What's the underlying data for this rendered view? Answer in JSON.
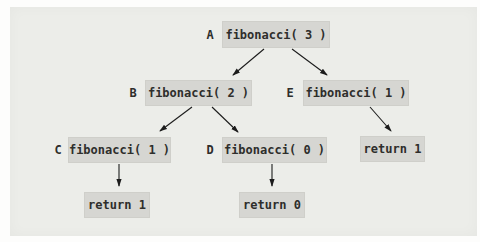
{
  "figure": {
    "nodes": {
      "A": {
        "label": "A",
        "text": "fibonacci( 3 )"
      },
      "B": {
        "label": "B",
        "text": "fibonacci( 2 )"
      },
      "E": {
        "label": "E",
        "text": "fibonacci( 1 )"
      },
      "C": {
        "label": "C",
        "text": "fibonacci( 1 )"
      },
      "D": {
        "label": "D",
        "text": "fibonacci( 0 )"
      },
      "return_E": {
        "text": "return 1"
      },
      "return_C": {
        "text": "return 1"
      },
      "return_D": {
        "text": "return 0"
      }
    },
    "edges": [
      {
        "from": "A",
        "to": "B"
      },
      {
        "from": "A",
        "to": "E"
      },
      {
        "from": "B",
        "to": "C"
      },
      {
        "from": "B",
        "to": "D"
      },
      {
        "from": "E",
        "to": "return_E"
      },
      {
        "from": "C",
        "to": "return_C"
      },
      {
        "from": "D",
        "to": "return_D"
      }
    ],
    "colors": {
      "box_fill": "#d6d6d2",
      "panel_background": "#ecede9",
      "page_background": "#fdfdfc",
      "text": "#2e2e2c",
      "arrow": "#1c1c1c"
    }
  }
}
